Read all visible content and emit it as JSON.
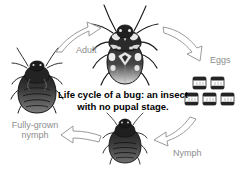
{
  "diagram": {
    "caption": "Life cycle of a bug: an insect with no pupal stage.",
    "background_color": "#ffffff",
    "label_color": "#8d8d8d",
    "caption_color": "#000000",
    "arrow_outline_color": "#9a9a9a",
    "arrow_fill_color": "#ffffff",
    "stages": [
      {
        "id": "adult",
        "label": "Adult"
      },
      {
        "id": "eggs",
        "label": "Eggs"
      },
      {
        "id": "nymph",
        "label": "Nymph"
      },
      {
        "id": "fully-grown-nymph",
        "label": "Fully-grown nymph"
      }
    ],
    "eggs": {
      "count": 5,
      "rows": [
        2,
        3
      ]
    },
    "arrows": [
      {
        "id": "arrow-fgn-to-adult",
        "from": "fully-grown-nymph",
        "to": "adult"
      },
      {
        "id": "arrow-adult-to-eggs",
        "from": "adult",
        "to": "eggs"
      },
      {
        "id": "arrow-eggs-to-nymph",
        "from": "eggs",
        "to": "nymph"
      },
      {
        "id": "arrow-nymph-to-fgn",
        "from": "nymph",
        "to": "fully-grown-nymph"
      }
    ]
  }
}
